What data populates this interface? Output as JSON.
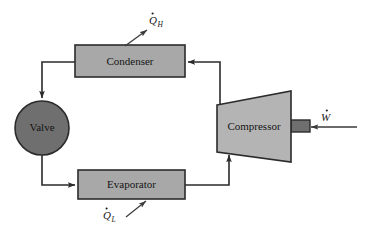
{
  "diagram": {
    "type": "thermodynamic-cycle-schematic",
    "background_color": "#ffffff",
    "components": {
      "condenser": {
        "label": "Condenser",
        "shape": "rectangle",
        "fill_color": "#a8a8a8",
        "stroke_color": "#2b2b2b",
        "x": 75,
        "y": 45,
        "width": 110,
        "height": 32
      },
      "evaporator": {
        "label": "Evaporator",
        "shape": "rectangle",
        "fill_color": "#a8a8a8",
        "stroke_color": "#2b2b2b",
        "x": 78,
        "y": 170,
        "width": 107,
        "height": 29
      },
      "valve": {
        "label": "Valve",
        "shape": "circle",
        "fill_color": "#6f6f6f",
        "stroke_color": "#2b2b2b",
        "cx": 42,
        "cy": 128,
        "r": 27
      },
      "compressor": {
        "label": "Compressor",
        "shape": "trapezoid",
        "fill_color": "#b4b4b4",
        "stroke_color": "#2b2b2b",
        "left_x": 217,
        "right_x": 291,
        "left_top_y": 105,
        "left_bottom_y": 152,
        "right_top_y": 91,
        "right_bottom_y": 162
      },
      "shaft": {
        "label": "",
        "shape": "rectangle",
        "fill_color": "#6f6f6f",
        "stroke_color": "#2b2b2b",
        "x": 291,
        "y": 120,
        "width": 19,
        "height": 12
      }
    },
    "energy_flows": [
      {
        "name": "heat-rejected",
        "symbol": "Q",
        "subscript": "H",
        "has_dot": true,
        "direction": "out",
        "label_x": 150,
        "label_y": 24,
        "arrow_from_x": 125,
        "arrow_from_y": 46,
        "arrow_to_x": 147,
        "arrow_to_y": 30
      },
      {
        "name": "heat-absorbed",
        "symbol": "Q",
        "subscript": "L",
        "has_dot": true,
        "direction": "in",
        "label_x": 104,
        "label_y": 219,
        "arrow_from_x": 128,
        "arrow_from_y": 216,
        "arrow_to_x": 145,
        "arrow_to_y": 200
      },
      {
        "name": "work-input",
        "symbol": "W",
        "subscript": "",
        "has_dot": true,
        "direction": "in",
        "label_x": 322,
        "label_y": 121,
        "arrow_from_x": 357,
        "arrow_from_y": 127,
        "arrow_to_x": 312,
        "arrow_to_y": 127
      }
    ],
    "flow_path": [
      {
        "name": "compressor-to-condenser",
        "from": "compressor",
        "to": "condenser",
        "points": "220,105 220,62 188,62"
      },
      {
        "name": "condenser-to-valve",
        "from": "condenser",
        "to": "valve",
        "points": "75,62 42,62 42,98"
      },
      {
        "name": "valve-to-evaporator",
        "from": "valve",
        "to": "evaporator",
        "points": "42,155 42,185 75,185"
      },
      {
        "name": "evaporator-to-compressor",
        "from": "evaporator",
        "to": "compressor",
        "points": "185,185 229,185 229,155"
      }
    ]
  }
}
